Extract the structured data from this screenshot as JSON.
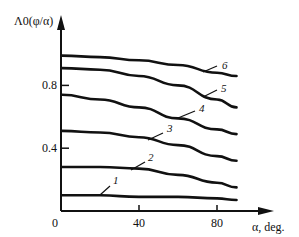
{
  "chart_data": {
    "type": "line",
    "title": "",
    "xlabel": "α, deg.",
    "ylabel": "Λ0(φ/α)",
    "xlim": [
      0,
      92
    ],
    "ylim": [
      0,
      1.05
    ],
    "grid": false,
    "legend": "inline curve numbers",
    "x_ticks": [
      0,
      40,
      80
    ],
    "x_tick_labels": [
      "0",
      "40",
      "80"
    ],
    "y_ticks": [
      0.4,
      0.8
    ],
    "y_tick_labels": [
      "0.4",
      "0.8"
    ],
    "x": [
      0,
      20,
      40,
      60,
      80,
      90
    ],
    "series": [
      {
        "name": "1",
        "values": [
          0.1,
          0.1,
          0.09,
          0.09,
          0.08,
          0.07
        ]
      },
      {
        "name": "2",
        "values": [
          0.28,
          0.28,
          0.27,
          0.23,
          0.18,
          0.15
        ]
      },
      {
        "name": "3",
        "values": [
          0.51,
          0.5,
          0.47,
          0.42,
          0.35,
          0.32
        ]
      },
      {
        "name": "4",
        "values": [
          0.74,
          0.71,
          0.66,
          0.59,
          0.52,
          0.49
        ]
      },
      {
        "name": "5",
        "values": [
          0.91,
          0.9,
          0.86,
          0.8,
          0.71,
          0.66
        ]
      },
      {
        "name": "6",
        "values": [
          0.99,
          0.98,
          0.96,
          0.93,
          0.88,
          0.86
        ]
      }
    ],
    "curve_labels": [
      {
        "text": "1",
        "x": 113,
        "y": 184,
        "lx1": 100,
        "ly1": 195,
        "lx2": 110,
        "ly2": 186
      },
      {
        "text": "2",
        "x": 148,
        "y": 161,
        "lx1": 131,
        "ly1": 170,
        "lx2": 145,
        "ly2": 162
      },
      {
        "text": "3",
        "x": 167,
        "y": 132,
        "lx1": 148,
        "ly1": 140,
        "lx2": 163,
        "ly2": 133
      },
      {
        "text": "4",
        "x": 199,
        "y": 112,
        "lx1": 178,
        "ly1": 118,
        "lx2": 195,
        "ly2": 111
      },
      {
        "text": "5",
        "x": 221,
        "y": 92,
        "lx1": 203,
        "ly1": 97,
        "lx2": 217,
        "ly2": 90
      },
      {
        "text": "6",
        "x": 222,
        "y": 69,
        "lx1": 203,
        "ly1": 72,
        "lx2": 217,
        "ly2": 66
      }
    ]
  }
}
